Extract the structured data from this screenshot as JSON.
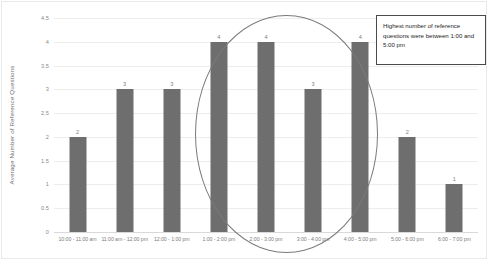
{
  "chart_data": {
    "type": "bar",
    "title": "",
    "subtitle": "",
    "xlabel": "",
    "ylabel": "Average Number of Reference Questions",
    "categories": [
      "10:00 - 11:00 am",
      "11:00 am - 12:00 pm",
      "12:00 - 1:00 pm",
      "1:00 - 2:00 pm",
      "2:00 - 3:00 pm",
      "3:00 - 4:00 pm",
      "4:00 - 5:00 pm",
      "5:00 - 6:00 pm",
      "6:00 - 7:00 pm"
    ],
    "values": [
      2,
      3,
      3,
      4,
      4,
      3,
      4,
      2,
      1
    ],
    "data_labels": [
      "2",
      "3",
      "3",
      "4",
      "4",
      "3",
      "4",
      "2",
      "1"
    ],
    "ylim": [
      0,
      4.5
    ],
    "yticks": [
      "0",
      "0.5",
      "1",
      "1.5",
      "2",
      "2.5",
      "3",
      "3.5",
      "4",
      "4.5"
    ],
    "ytick_values": [
      0,
      0.5,
      1,
      1.5,
      2,
      2.5,
      3,
      3.5,
      4,
      4.5
    ],
    "grid": true,
    "legend": false,
    "legend_position": "none",
    "bar_color": "#6e6e6e",
    "gridline_color": "#ededed",
    "annotations": [
      {
        "name": "callout-text-box",
        "text": "Highest number of reference questions were between 1:00 and 5:00 pm"
      },
      {
        "name": "highlight-ellipse",
        "covers": [
          "1:00 - 2:00 pm",
          "2:00 - 3:00 pm",
          "3:00 - 4:00 pm",
          "4:00 - 5:00 pm"
        ]
      }
    ]
  }
}
